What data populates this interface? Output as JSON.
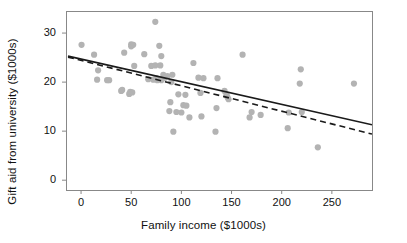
{
  "chart_data": {
    "type": "scatter",
    "title": "",
    "xlabel": "Family income ($1000s)",
    "ylabel": "Gift aid from university ($1000s)",
    "xlim": [
      -15,
      290
    ],
    "ylim": [
      -2,
      34.5
    ],
    "xticks": [
      0,
      50,
      100,
      150,
      200,
      250
    ],
    "yticks": [
      0,
      10,
      20,
      30
    ],
    "grid": false,
    "legend": "none",
    "point_color": "#b3b3b3",
    "line_color": "#1a1a1a",
    "frame_color": "#888888",
    "x": [
      0.5,
      13,
      16,
      17,
      26,
      28,
      40,
      41,
      43,
      48,
      49,
      50,
      50,
      51,
      52,
      53,
      63,
      67,
      70,
      72,
      74,
      74,
      75,
      76,
      78,
      79,
      80,
      80,
      82,
      83,
      86,
      88,
      89,
      90,
      91,
      92,
      95,
      97,
      100,
      102,
      104,
      105,
      108,
      112,
      117,
      119,
      120,
      122,
      134,
      135,
      136,
      143,
      145,
      146,
      147,
      161,
      168,
      170,
      179,
      206,
      207,
      218,
      219,
      220,
      236,
      272
    ],
    "y": [
      27.6,
      25.6,
      20.5,
      22.4,
      20.4,
      20.4,
      18.2,
      18.4,
      26.0,
      17.6,
      18.0,
      27.3,
      27.7,
      17.9,
      27.6,
      23.3,
      25.7,
      20.6,
      23.3,
      20.5,
      32.3,
      23.4,
      20.8,
      20.4,
      27.4,
      23.4,
      20.4,
      25.3,
      21.5,
      20.8,
      21.2,
      14.1,
      15.9,
      20.0,
      21.5,
      9.9,
      13.9,
      17.5,
      13.8,
      15.3,
      17.4,
      15.2,
      12.8,
      23.9,
      20.9,
      17.8,
      13.0,
      20.8,
      9.9,
      14.7,
      20.8,
      18.2,
      17.5,
      16.9,
      16.5,
      25.6,
      12.8,
      13.9,
      13.3,
      10.6,
      13.8,
      19.7,
      22.6,
      13.9,
      6.7,
      19.7
    ],
    "lines": [
      {
        "name": "least-squares-line",
        "style": "solid",
        "x0": -13,
        "y0": 25.3,
        "x1": 290,
        "y1": 11.3
      },
      {
        "name": "alternate-fit-line",
        "style": "dashed",
        "x0": -13,
        "y0": 25.1,
        "x1": 290,
        "y1": 9.4
      }
    ]
  }
}
